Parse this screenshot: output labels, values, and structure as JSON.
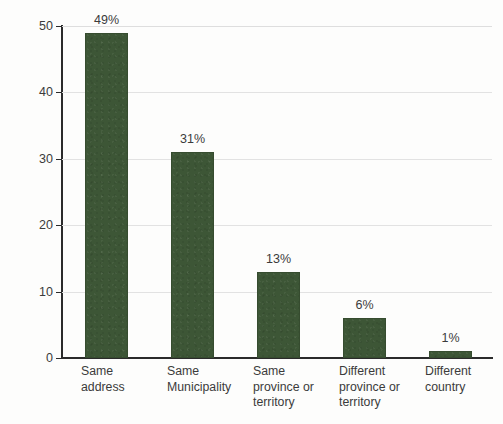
{
  "chart_data": {
    "type": "bar",
    "title": "",
    "xlabel": "",
    "ylabel": "Percentage (%)",
    "categories": [
      "Same\naddress",
      "Same\nMunicipality",
      "Same\nprovince or\nterritory",
      "Different\nprovince or\nterritory",
      "Different\ncountry"
    ],
    "values": [
      49,
      31,
      13,
      6,
      1
    ],
    "data_labels": [
      "49%",
      "31%",
      "13%",
      "6%",
      "1%"
    ],
    "ylim": [
      0,
      50
    ],
    "ytick_labels": [
      "0",
      "10",
      "20",
      "30",
      "40",
      "50"
    ],
    "ytick_values": [
      0,
      10,
      20,
      30,
      40,
      50
    ],
    "grid": "horizontal",
    "legend": "none",
    "bar_color": "#3d5636",
    "axis_color": "#2b2b2b",
    "grid_color": "#e2e2e2",
    "text_color": "#3b3b3b",
    "background_color": "#fdfdfc"
  }
}
